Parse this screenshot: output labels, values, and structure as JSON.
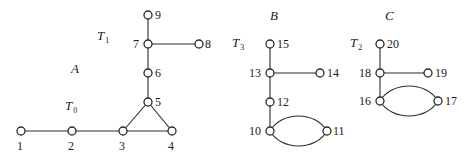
{
  "diagram": {
    "type": "graph",
    "region_labels": [
      {
        "id": "A",
        "text": "A",
        "x": 71,
        "y": 73
      },
      {
        "id": "B",
        "text": "B",
        "x": 270,
        "y": 20
      },
      {
        "id": "C",
        "text": "C",
        "x": 385,
        "y": 20
      }
    ],
    "tree_labels": [
      {
        "id": "T1",
        "main": "T",
        "sub": "1",
        "x": 97,
        "y": 40
      },
      {
        "id": "T0",
        "main": "T",
        "sub": "0",
        "x": 65,
        "y": 110
      },
      {
        "id": "T3",
        "main": "T",
        "sub": "3",
        "x": 232,
        "y": 47
      },
      {
        "id": "T2",
        "main": "T",
        "sub": "2",
        "x": 350,
        "y": 47
      }
    ],
    "nodes": [
      {
        "id": "1",
        "x": 21,
        "y": 131,
        "lx": 17,
        "ly": 150
      },
      {
        "id": "2",
        "x": 72,
        "y": 131,
        "lx": 68,
        "ly": 150
      },
      {
        "id": "3",
        "x": 123,
        "y": 131,
        "lx": 119,
        "ly": 150
      },
      {
        "id": "4",
        "x": 172,
        "y": 131,
        "lx": 168,
        "ly": 150
      },
      {
        "id": "5",
        "x": 148,
        "y": 102,
        "lx": 155,
        "ly": 106
      },
      {
        "id": "6",
        "x": 148,
        "y": 73,
        "lx": 155,
        "ly": 77
      },
      {
        "id": "7",
        "x": 148,
        "y": 44,
        "lx": 133,
        "ly": 48
      },
      {
        "id": "8",
        "x": 199,
        "y": 44,
        "lx": 205,
        "ly": 48
      },
      {
        "id": "9",
        "x": 148,
        "y": 15,
        "lx": 155,
        "ly": 19
      },
      {
        "id": "10",
        "x": 270,
        "y": 131,
        "lx": 249,
        "ly": 135
      },
      {
        "id": "11",
        "x": 327,
        "y": 131,
        "lx": 333,
        "ly": 135
      },
      {
        "id": "12",
        "x": 270,
        "y": 102,
        "lx": 277,
        "ly": 106
      },
      {
        "id": "13",
        "x": 270,
        "y": 73,
        "lx": 249,
        "ly": 77
      },
      {
        "id": "14",
        "x": 320,
        "y": 73,
        "lx": 327,
        "ly": 77
      },
      {
        "id": "15",
        "x": 270,
        "y": 44,
        "lx": 277,
        "ly": 48
      },
      {
        "id": "16",
        "x": 380,
        "y": 101,
        "lx": 359,
        "ly": 105
      },
      {
        "id": "17",
        "x": 438,
        "y": 101,
        "lx": 445,
        "ly": 105
      },
      {
        "id": "18",
        "x": 380,
        "y": 73,
        "lx": 359,
        "ly": 77
      },
      {
        "id": "19",
        "x": 428,
        "y": 73,
        "lx": 435,
        "ly": 77
      },
      {
        "id": "20",
        "x": 380,
        "y": 44,
        "lx": 387,
        "ly": 48
      }
    ],
    "edges": [
      {
        "from": "1",
        "to": "2"
      },
      {
        "from": "2",
        "to": "3"
      },
      {
        "from": "3",
        "to": "4"
      },
      {
        "from": "3",
        "to": "5"
      },
      {
        "from": "4",
        "to": "5"
      },
      {
        "from": "5",
        "to": "6"
      },
      {
        "from": "6",
        "to": "7"
      },
      {
        "from": "7",
        "to": "9"
      },
      {
        "from": "7",
        "to": "8"
      },
      {
        "from": "15",
        "to": "13"
      },
      {
        "from": "13",
        "to": "14"
      },
      {
        "from": "13",
        "to": "12"
      },
      {
        "from": "12",
        "to": "10"
      },
      {
        "from": "10",
        "to": "11",
        "curve": "upper"
      },
      {
        "from": "10",
        "to": "11",
        "curve": "lower"
      },
      {
        "from": "20",
        "to": "18"
      },
      {
        "from": "18",
        "to": "19"
      },
      {
        "from": "18",
        "to": "16"
      },
      {
        "from": "16",
        "to": "17",
        "curve": "upper"
      },
      {
        "from": "16",
        "to": "17",
        "curve": "lower"
      }
    ]
  }
}
